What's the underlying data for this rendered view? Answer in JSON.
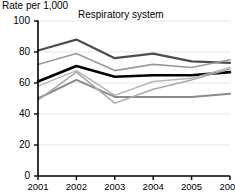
{
  "axis_title": "Rate per 1,000",
  "chart_data": {
    "type": "line",
    "title": "Respiratory system",
    "xlabel": "",
    "ylabel": "Rate per 1,000",
    "ylim": [
      0,
      100
    ],
    "yticks": [
      0,
      20,
      40,
      60,
      80,
      100
    ],
    "grid": true,
    "legend": "none",
    "categories": [
      "2001",
      "2002",
      "2003",
      "2004",
      "2005",
      "2006"
    ],
    "series": [
      {
        "name": "series-1",
        "color": "#4d4d4d",
        "width": 2.2,
        "values": [
          81,
          88,
          76,
          79,
          74,
          73
        ]
      },
      {
        "name": "series-2",
        "color": "#9a9a9a",
        "width": 1.6,
        "values": [
          72,
          79,
          68,
          72,
          70,
          75
        ]
      },
      {
        "name": "series-3",
        "color": "#000000",
        "width": 2.6,
        "values": [
          61,
          71,
          64,
          65,
          65,
          67
        ]
      },
      {
        "name": "series-4",
        "color": "#b5b5b5",
        "width": 1.5,
        "values": [
          58,
          68,
          52,
          61,
          63,
          70
        ]
      },
      {
        "name": "series-5",
        "color": "#8a8a8a",
        "width": 2.0,
        "values": [
          50,
          62,
          51,
          51,
          51,
          53
        ]
      },
      {
        "name": "series-6",
        "color": "#a8a8a8",
        "width": 1.5,
        "values": [
          49,
          67,
          47,
          56,
          62,
          69
        ]
      }
    ]
  }
}
